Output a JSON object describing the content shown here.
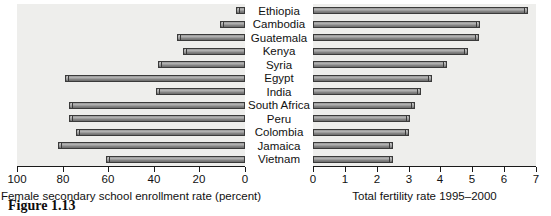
{
  "figure": {
    "caption": "Figure 1.13",
    "countries": [
      "Ethiopia",
      "Cambodia",
      "Guatemala",
      "Kenya",
      "Syria",
      "Egypt",
      "India",
      "South Africa",
      "Peru",
      "Colombia",
      "Jamaica",
      "Vietnam"
    ]
  },
  "chart_data": [
    {
      "type": "bar",
      "orientation": "horizontal",
      "id": "left-panel",
      "title": "",
      "xlabel": "Female secondary school enrollment rate (percent)",
      "ylabel": "",
      "xlim": [
        100,
        0
      ],
      "x_reversed": true,
      "xticks": [
        100,
        80,
        60,
        40,
        20,
        0
      ],
      "xtick_labels": [
        "100",
        "80",
        "60",
        "40",
        "20",
        "0"
      ],
      "grid": false,
      "legend": "none",
      "categories": [
        "Ethiopia",
        "Cambodia",
        "Guatemala",
        "Kenya",
        "Syria",
        "Egypt",
        "India",
        "South Africa",
        "Peru",
        "Colombia",
        "Jamaica",
        "Vietnam"
      ],
      "values": [
        4,
        11,
        30,
        27,
        38,
        79,
        39,
        77,
        77,
        74,
        82,
        61
      ]
    },
    {
      "type": "bar",
      "orientation": "horizontal",
      "id": "right-panel",
      "title": "",
      "xlabel": "Total fertility rate 1995–2000",
      "ylabel": "",
      "xlim": [
        0,
        7
      ],
      "x_reversed": false,
      "xticks": [
        0,
        1,
        2,
        3,
        4,
        5,
        6,
        7
      ],
      "xtick_labels": [
        "0",
        "1",
        "2",
        "3",
        "4",
        "5",
        "6",
        "7"
      ],
      "grid": false,
      "legend": "none",
      "categories": [
        "Ethiopia",
        "Cambodia",
        "Guatemala",
        "Kenya",
        "Syria",
        "Egypt",
        "India",
        "South Africa",
        "Peru",
        "Colombia",
        "Jamaica",
        "Vietnam"
      ],
      "values": [
        6.75,
        5.25,
        5.2,
        4.85,
        4.2,
        3.75,
        3.4,
        3.2,
        3.05,
        3.0,
        2.5,
        2.5
      ]
    }
  ]
}
